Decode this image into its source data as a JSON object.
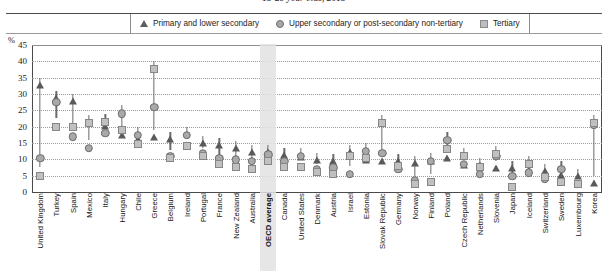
{
  "chart_data": {
    "type": "scatter",
    "title": "15-29 year olds, 2015",
    "ylabel": "%",
    "xlabel": "",
    "ylim": [
      0,
      45
    ],
    "yticks": [
      45,
      40,
      35,
      30,
      25,
      20,
      15,
      10,
      5,
      0
    ],
    "grid": true,
    "legend_position": "top",
    "highlight_category": "OECD average",
    "legend": [
      {
        "name": "Primary and lower secondary",
        "marker": "triangle"
      },
      {
        "name": "Upper secondary or post-secondary non-tertiary",
        "marker": "circle"
      },
      {
        "name": "Tertiary",
        "marker": "square"
      }
    ],
    "categories": [
      "United Kingdom",
      "Turkey",
      "Spain",
      "Mexico",
      "Italy",
      "Hungary",
      "Chile",
      "Greece",
      "Belgium",
      "Ireland",
      "Portugal",
      "France",
      "New Zealand",
      "Australia",
      "OECD average",
      "Canada",
      "United States",
      "Denmark",
      "Austria",
      "Israel",
      "Estonia",
      "Slovak Republic",
      "Germany",
      "Norway",
      "Finland",
      "Poland",
      "Czech Republic",
      "Netherlands",
      "Slovenia",
      "Japan",
      "Iceland",
      "Switzerland",
      "Sweden",
      "Luxembourg",
      "Korea"
    ],
    "series": [
      {
        "name": "Primary and lower secondary",
        "marker": "triangle",
        "values": [
          35.0,
          31.0,
          30.0,
          23.5,
          22.5,
          19.5,
          18.5,
          19.0,
          18.5,
          16.5,
          17.0,
          16.5,
          15.5,
          14.5,
          14.5,
          13.5,
          13.0,
          12.0,
          11.5,
          14.5,
          12.0,
          11.5,
          11.5,
          11.0,
          11.5,
          12.5,
          10.5,
          10.5,
          9.5,
          9.5,
          9.0,
          8.5,
          7.5,
          7.0,
          5.0
        ]
      },
      {
        "name": "Upper secondary or post-secondary non-tertiary",
        "marker": "circle",
        "values": [
          13.0,
          30.0,
          19.5,
          16.0,
          20.5,
          26.5,
          20.0,
          28.5,
          13.5,
          20.0,
          14.5,
          13.0,
          12.5,
          12.0,
          14.0,
          12.0,
          13.5,
          9.5,
          10.0,
          8.0,
          15.0,
          14.5,
          9.5,
          6.0,
          12.0,
          18.5,
          11.0,
          8.0,
          13.5,
          7.5,
          8.5,
          6.5,
          9.5,
          5.0,
          23.0
        ]
      },
      {
        "name": "Tertiary",
        "marker": "square",
        "values": [
          7.5,
          22.5,
          22.5,
          23.5,
          24.0,
          21.5,
          17.0,
          40.0,
          13.0,
          16.5,
          13.5,
          11.0,
          10.0,
          9.5,
          12.0,
          10.0,
          10.0,
          8.5,
          8.0,
          13.5,
          13.0,
          23.5,
          10.5,
          5.0,
          5.5,
          15.5,
          13.5,
          10.0,
          14.0,
          4.0,
          11.0,
          7.0,
          5.5,
          5.0,
          23.5
        ]
      }
    ]
  }
}
